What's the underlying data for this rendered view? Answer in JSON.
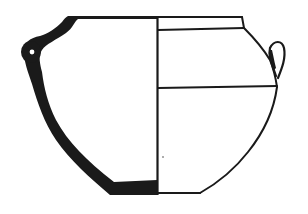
{
  "figure": {
    "type": "archaeological pottery drawing",
    "subject": "vessel profile with section (left) and exterior view (right)",
    "colors": {
      "background": "#ffffff",
      "ink": "#1a1a1a"
    },
    "parts": {
      "section": "left half, wall profile filled black",
      "exterior": "right half, outline with horizontal lines",
      "handles": [
        "left lug handle",
        "right lug handle"
      ]
    }
  }
}
